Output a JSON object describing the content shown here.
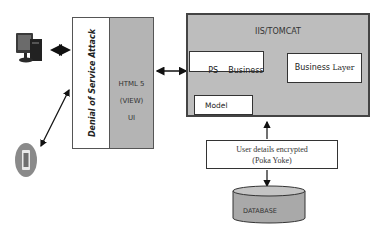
{
  "diagram": {
    "client_desktop": {
      "icon": "desktop-computer-icon"
    },
    "client_mobile": {
      "icon": "mobile-phone-icon"
    },
    "security_layer": {
      "label": "Denial of Service Attack"
    },
    "view_layer": {
      "lines": [
        "HTML 5",
        "(VIEW)",
        "UI"
      ]
    },
    "server": {
      "title": "IIS/TOMCAT",
      "ps_business": {
        "prefix": "PS",
        "label": "Business"
      },
      "model": {
        "label": "Model"
      },
      "business_layer": {
        "word1": "Business",
        "word2": "Layer"
      }
    },
    "encryption": {
      "lines": [
        "User details encrypted",
        "(Poka Yoke)"
      ]
    },
    "database": {
      "label": "DATABASE"
    },
    "colors": {
      "panel_gray": "#b4b4b4",
      "server_gray": "#bdbdbd",
      "db_gray": "#a9a9a9",
      "border": "#444444"
    }
  }
}
